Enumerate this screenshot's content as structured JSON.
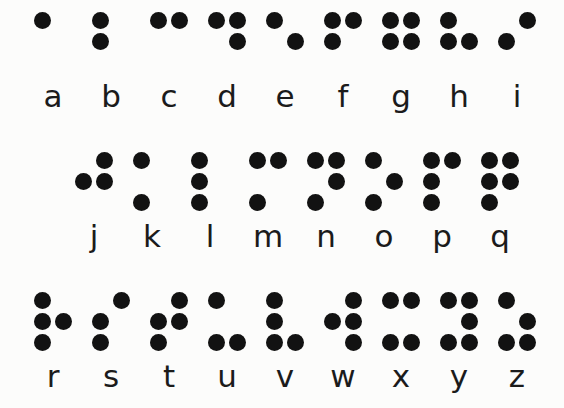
{
  "chart": {
    "dot_color": "#121212",
    "background_color": "#fcfcfb",
    "label_color": "#1b1b1b",
    "cell_layout": "2 columns x 3 rows",
    "dot_numbering": "1=top-left, 2=middle-left, 3=bottom-left, 4=top-right, 5=middle-right, 6=bottom-right"
  },
  "rows": [
    {
      "row_index": 0,
      "letters": [
        {
          "label": "a",
          "dots": [
            1
          ]
        },
        {
          "label": "b",
          "dots": [
            1,
            2
          ]
        },
        {
          "label": "c",
          "dots": [
            1,
            4
          ]
        },
        {
          "label": "d",
          "dots": [
            1,
            4,
            5
          ]
        },
        {
          "label": "e",
          "dots": [
            1,
            5
          ]
        },
        {
          "label": "f",
          "dots": [
            1,
            2,
            4
          ]
        },
        {
          "label": "g",
          "dots": [
            1,
            2,
            4,
            5
          ]
        },
        {
          "label": "h",
          "dots": [
            1,
            2,
            5
          ]
        },
        {
          "label": "i",
          "dots": [
            2,
            4
          ]
        }
      ]
    },
    {
      "row_index": 1,
      "letters": [
        {
          "label": "j",
          "dots": [
            2,
            4,
            5
          ]
        },
        {
          "label": "k",
          "dots": [
            1,
            3
          ]
        },
        {
          "label": "l",
          "dots": [
            1,
            2,
            3
          ]
        },
        {
          "label": "m",
          "dots": [
            1,
            3,
            4
          ]
        },
        {
          "label": "n",
          "dots": [
            1,
            3,
            4,
            5
          ]
        },
        {
          "label": "o",
          "dots": [
            1,
            3,
            5
          ]
        },
        {
          "label": "p",
          "dots": [
            1,
            2,
            3,
            4
          ]
        },
        {
          "label": "q",
          "dots": [
            1,
            2,
            3,
            4,
            5
          ]
        }
      ]
    },
    {
      "row_index": 2,
      "letters": [
        {
          "label": "r",
          "dots": [
            1,
            2,
            3,
            5
          ]
        },
        {
          "label": "s",
          "dots": [
            2,
            3,
            4
          ]
        },
        {
          "label": "t",
          "dots": [
            2,
            3,
            4,
            5
          ]
        },
        {
          "label": "u",
          "dots": [
            1,
            3,
            6
          ]
        },
        {
          "label": "v",
          "dots": [
            1,
            2,
            3,
            6
          ]
        },
        {
          "label": "w",
          "dots": [
            2,
            4,
            5,
            6
          ]
        },
        {
          "label": "x",
          "dots": [
            1,
            3,
            4,
            6
          ]
        },
        {
          "label": "y",
          "dots": [
            1,
            3,
            4,
            5,
            6
          ]
        },
        {
          "label": "z",
          "dots": [
            1,
            3,
            5,
            6
          ]
        }
      ]
    }
  ],
  "row_offsets_px": [
    24,
    65,
    24
  ]
}
